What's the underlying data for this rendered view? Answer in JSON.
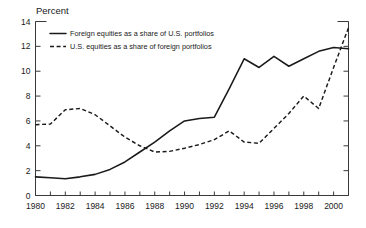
{
  "chart_data": {
    "type": "line",
    "title": "",
    "ylabel": "Percent",
    "xlabel": "",
    "ylim": [
      0,
      14
    ],
    "xlim": [
      1980,
      2001
    ],
    "yticks": [
      0,
      2,
      4,
      6,
      8,
      10,
      12,
      14
    ],
    "xticks": [
      1980,
      1982,
      1984,
      1986,
      1988,
      1990,
      1992,
      1994,
      1996,
      1998,
      2000
    ],
    "xtick_labels": [
      "1980",
      "1982",
      "1984",
      "1986",
      "1988",
      "1990",
      "1992",
      "1994",
      "1996",
      "1998",
      "2000"
    ],
    "ytick_labels": [
      "0",
      "2",
      "4",
      "6",
      "8",
      "10",
      "12",
      "14"
    ],
    "grid": false,
    "minor_xticks_every": 1,
    "legend_position": "upper-left-inside",
    "x": [
      1980,
      1981,
      1982,
      1983,
      1984,
      1985,
      1986,
      1987,
      1988,
      1989,
      1990,
      1991,
      1992,
      1993,
      1994,
      1995,
      1996,
      1997,
      1998,
      1999,
      2000,
      2001
    ],
    "series": [
      {
        "name": "Foreign equities as a share of U.S. portfolios",
        "style": "solid",
        "values": [
          1.5,
          1.42,
          1.35,
          1.5,
          1.7,
          2.1,
          2.7,
          3.5,
          4.3,
          5.2,
          6.0,
          6.2,
          6.3,
          8.6,
          11.0,
          10.3,
          11.2,
          10.4,
          11.0,
          11.6,
          11.9,
          11.8
        ]
      },
      {
        "name": "U.S. equities as a share of foreign portfolios",
        "style": "dashed",
        "values": [
          5.7,
          5.75,
          6.9,
          7.0,
          6.5,
          5.6,
          4.7,
          4.0,
          3.5,
          3.55,
          3.8,
          4.1,
          4.5,
          5.2,
          4.3,
          4.2,
          5.4,
          6.6,
          8.0,
          7.0,
          10.3,
          13.5
        ]
      }
    ]
  },
  "legend": {
    "items": [
      {
        "label": "Foreign equities as a share of U.S. portfolios",
        "style": "solid"
      },
      {
        "label": "U.S. equities as a share of foreign portfolios",
        "style": "dashed"
      }
    ]
  },
  "axes": {
    "y_title": "Percent"
  }
}
